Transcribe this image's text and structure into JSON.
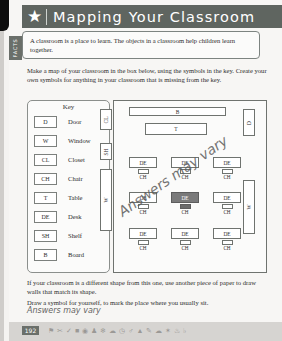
{
  "page": {
    "number": "192",
    "edge_color": "#0d0d0d",
    "paper_color": "#f7f6f4"
  },
  "header": {
    "title": "Mapping Your Classroom",
    "star_icon": "star-icon",
    "bar_color": "#5f6560",
    "text_color": "#ffffff"
  },
  "facts": {
    "tab_label": "FACTS",
    "text": "A classroom is a place to learn. The objects in a classroom help children learn together."
  },
  "instructions": {
    "text": "Make a map of your classroom in the box below, using the symbols in the key. Create your own symbols for anything in your classroom that is missing from the key."
  },
  "key": {
    "title": "Key",
    "rows": [
      {
        "symbol": "D",
        "label": "Door"
      },
      {
        "symbol": "W",
        "label": "Window"
      },
      {
        "symbol": "CL",
        "label": "Closet"
      },
      {
        "symbol": "CH",
        "label": "Chair"
      },
      {
        "symbol": "T",
        "label": "Table"
      },
      {
        "symbol": "DE",
        "label": "Desk"
      },
      {
        "symbol": "SH",
        "label": "Shelf"
      },
      {
        "symbol": "B",
        "label": "Board"
      }
    ]
  },
  "map": {
    "board": "B",
    "table": "T",
    "door_right": "D",
    "window_right": "W",
    "closet_left": "CL",
    "shelf_left": "SH",
    "window_left": "W",
    "desk_label": "DE",
    "chair_label": "CH",
    "marked_seat_color": "#7a7a7a",
    "desks": [
      {
        "desk": "DE",
        "chair": "CH",
        "marked": false
      },
      {
        "desk": "DE",
        "chair": "CH",
        "marked": false
      },
      {
        "desk": "DE",
        "chair": "CH",
        "marked": false
      },
      {
        "desk": "DE",
        "chair": "CH",
        "marked": false
      },
      {
        "desk": "DE",
        "chair": "CH",
        "marked": true
      },
      {
        "desk": "DE",
        "chair": "CH",
        "marked": false
      },
      {
        "desk": "DE",
        "chair": "CH",
        "marked": false
      },
      {
        "desk": "DE",
        "chair": "CH",
        "marked": false
      },
      {
        "desk": "DE",
        "chair": "CH",
        "marked": false
      }
    ]
  },
  "annotations": {
    "map_note": "Answers may vary",
    "bottom_note": "Answers may vary"
  },
  "bottom": {
    "paragraph1": "If your classroom is a different shape from this one, use another piece of paper to draw walls that match its shape.",
    "paragraph2": "Draw a symbol for yourself, to mark the place where you usually sit."
  },
  "footer": {
    "icons": [
      "flag-icon",
      "scissors-icon",
      "check-icon",
      "square-icon",
      "camera-icon",
      "people-icon",
      "snowflake-icon",
      "cloud-icon",
      "clock-icon",
      "person-icon",
      "thumbsup-icon",
      "pencil-icon",
      "cloud2-icon",
      "star-small-icon",
      "leaf-icon",
      "bell-icon"
    ]
  }
}
